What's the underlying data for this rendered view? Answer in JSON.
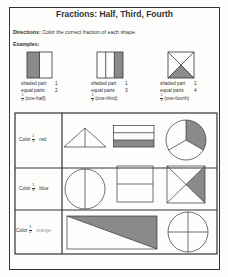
{
  "title": "Fractions: Half, Third, Fourth",
  "directions": {
    "label": "Directions:",
    "text": "Color the correct fraction of each shape."
  },
  "examples_label": "Examples:",
  "examples": [
    {
      "shaded_part_label": "shaded part",
      "shaded_part_value": "1",
      "equal_parts_label": "equal parts",
      "equal_parts_value": "2",
      "fraction_num": "1",
      "fraction_den": "2",
      "fraction_name": "(one-half)"
    },
    {
      "shaded_part_label": "shaded part",
      "shaded_part_value": "1",
      "equal_parts_label": "equal parts",
      "equal_parts_value": "3",
      "fraction_num": "1",
      "fraction_den": "3",
      "fraction_name": "(one-third)"
    },
    {
      "shaded_part_label": "shaded part",
      "shaded_part_value": "1",
      "equal_parts_label": "equal parts",
      "equal_parts_value": "4",
      "fraction_num": "1",
      "fraction_den": "4",
      "fraction_name": "(one-fourth)"
    }
  ],
  "rows": [
    {
      "prefix": "Color",
      "fraction_num": "1",
      "fraction_den": "3",
      "color_word": "red"
    },
    {
      "prefix": "Color",
      "fraction_num": "1",
      "fraction_den": "4",
      "color_word": "blue"
    },
    {
      "prefix": "Color",
      "fraction_num": "1",
      "fraction_den": "2",
      "color_word": "orange"
    }
  ],
  "colors": {
    "ink": "#333333",
    "shade": "#8a8a8a",
    "paper": "#fdfdfb",
    "faint_text": "#9a9a9a"
  }
}
